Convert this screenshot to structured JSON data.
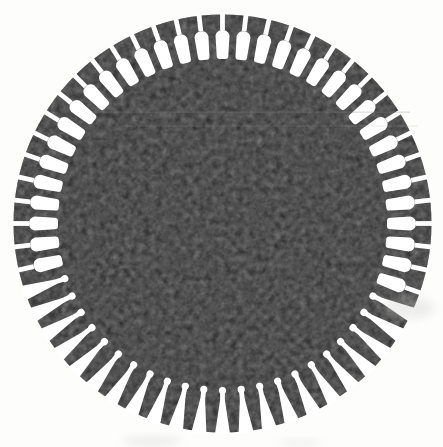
{
  "figure": {
    "type": "slotted_disc_lamination",
    "canvas": {
      "width": 443,
      "height": 447
    },
    "background_color": "#fdfdfc",
    "disc": {
      "cx": 222.5,
      "cy": 223.5,
      "radius": 209,
      "color": "#121212"
    },
    "slots": {
      "count": 56,
      "color": "#ffffff",
      "first_slot_angle_deg": 0,
      "style_ranges": [
        {
          "style": "neck_outward",
          "from": 0,
          "to": 17
        },
        {
          "style": "neck_inward",
          "from": 18,
          "to": 39
        },
        {
          "style": "neck_outward",
          "from": 40,
          "to": 55
        }
      ],
      "styles": {
        "neck_outward": {
          "slit_w": 4.8,
          "slit_outer_r": 211,
          "slit_inner_r": 193.5,
          "body_top": 195.5,
          "body_shoulder": 188,
          "body_halfwidth": 7.0,
          "body_bottom": 164.5,
          "body_bottom_halfwidth": 5.8,
          "corner": 3.2
        },
        "neck_inward": {
          "mouth_halfwidth": 7.6,
          "mouth_r": 211,
          "taper_to_r": 176.5,
          "taper_halfwidth": 2.4,
          "stem_halfwidth": 2.4,
          "stem_outer_r": 178,
          "stem_inner_r": 168,
          "bulb_center_r": 167,
          "bulb_r": 3.6
        }
      }
    },
    "scan_artifacts": {
      "streaks": [
        {
          "x": 92,
          "y": 111.5,
          "w": 318,
          "h": 1.3,
          "color": "#8a8a8a",
          "opacity": 0.28
        },
        {
          "x": 120,
          "y": 125.5,
          "w": 298,
          "h": 1.0,
          "color": "#9a9a9a",
          "opacity": 0.22
        }
      ],
      "smudges": [
        {
          "cx": 408,
          "cy": 308,
          "rx": 26,
          "ry": 11,
          "color": "#c8c8c4",
          "opacity": 0.3
        },
        {
          "cx": 152,
          "cy": 441,
          "rx": 30,
          "ry": 4,
          "color": "#bdbdb8",
          "opacity": 0.3
        },
        {
          "cx": 300,
          "cy": 443,
          "rx": 22,
          "ry": 3,
          "color": "#c4c4c0",
          "opacity": 0.25
        }
      ],
      "grain_opacity": 0.5
    }
  }
}
